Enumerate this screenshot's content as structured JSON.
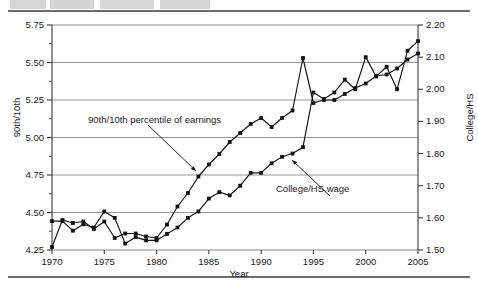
{
  "figure": {
    "x_axis_label": "Year",
    "left_axis_label": "90th/10th",
    "right_axis_label": "College/HS"
  },
  "annotations": {
    "series1": "90th/10th percentile of earnings",
    "series2": "College/HS wage"
  },
  "chart_data": {
    "type": "line",
    "title": "",
    "xlabel": "Year",
    "ylabel": "90th/10th",
    "y2label": "College/HS",
    "xlim": [
      1970,
      2005
    ],
    "ylim": [
      4.25,
      5.75
    ],
    "y2lim": [
      1.5,
      2.2
    ],
    "grid": true,
    "legend": "none",
    "xticks": [
      1970,
      1975,
      1980,
      1985,
      1990,
      1995,
      2000,
      2005
    ],
    "yticks": [
      4.25,
      4.5,
      4.75,
      5.0,
      5.25,
      5.5,
      5.75
    ],
    "y2ticks": [
      1.5,
      1.6,
      1.7,
      1.8,
      1.9,
      2.0,
      2.1,
      2.2
    ],
    "x": [
      1970,
      1971,
      1972,
      1973,
      1974,
      1975,
      1976,
      1977,
      1978,
      1979,
      1980,
      1981,
      1982,
      1983,
      1984,
      1985,
      1986,
      1987,
      1988,
      1989,
      1990,
      1991,
      1992,
      1993,
      1994,
      1995,
      1996,
      1997,
      1998,
      1999,
      2000,
      2001,
      2002,
      2003,
      2004,
      2005
    ],
    "series": [
      {
        "name": "90th/10th percentile of earnings",
        "axis": "left",
        "marker": "square",
        "values": [
          4.27,
          4.45,
          4.43,
          4.44,
          4.39,
          4.44,
          4.33,
          4.36,
          4.36,
          4.34,
          4.33,
          4.42,
          4.54,
          4.63,
          4.74,
          4.82,
          4.89,
          4.97,
          5.03,
          5.09,
          5.13,
          5.07,
          5.13,
          5.18,
          5.53,
          5.23,
          5.25,
          5.25,
          5.29,
          5.33,
          5.36,
          5.41,
          5.42,
          5.46,
          5.52,
          5.56
        ]
      },
      {
        "name": "College/HS wage",
        "axis": "right",
        "marker": "square",
        "values": [
          1.59,
          1.59,
          1.56,
          1.58,
          1.57,
          1.62,
          1.6,
          1.52,
          1.54,
          1.53,
          1.53,
          1.55,
          1.57,
          1.6,
          1.62,
          1.66,
          1.68,
          1.67,
          1.7,
          1.74,
          1.74,
          1.77,
          1.79,
          1.8,
          1.82,
          1.99,
          1.97,
          1.99,
          2.03,
          2.0,
          2.1,
          2.04,
          2.07,
          2.0,
          2.12,
          2.15
        ]
      }
    ]
  }
}
